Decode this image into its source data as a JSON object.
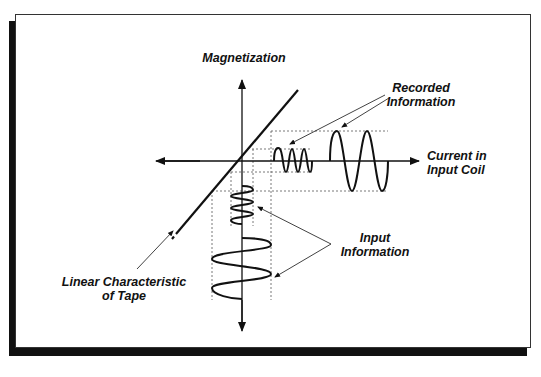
{
  "diagram": {
    "axes": {
      "vertical_label": "Magnetization",
      "horizontal_label_line1": "Current in",
      "horizontal_label_line2": "Input Coil"
    },
    "labels": {
      "recorded_line1": "Recorded",
      "recorded_line2": "Information",
      "input_line1": "Input",
      "input_line2": "Information",
      "linear_line1": "Linear Characteristic",
      "linear_line2": "of Tape"
    },
    "colors": {
      "ink": "#111111",
      "guide": "#555555",
      "background": "#ffffff",
      "shadow": "#111111"
    }
  }
}
